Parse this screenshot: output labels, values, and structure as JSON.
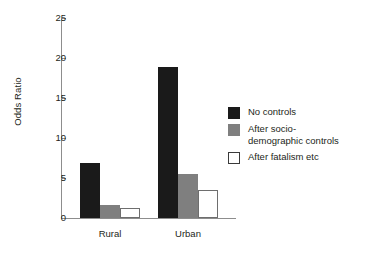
{
  "chart_data": {
    "type": "bar",
    "title": "",
    "xlabel": "",
    "ylabel": "Odds Ratio",
    "ylim": [
      0,
      25
    ],
    "yticks": [
      0,
      5,
      10,
      15,
      20,
      25
    ],
    "ytick_labels": [
      "0",
      "5",
      "10",
      "15",
      "20",
      "25"
    ],
    "grid": false,
    "legend_position": "right",
    "categories": [
      "Rural",
      "Urban"
    ],
    "series": [
      {
        "name": "No controls",
        "color": "#1a1a1a",
        "values": [
          6.9,
          18.9
        ]
      },
      {
        "name": "After socio-demographic controls",
        "color": "#7f7f7f",
        "values": [
          1.6,
          5.5
        ]
      },
      {
        "name": "After fatalism etc",
        "color": "#ffffff",
        "values": [
          1.2,
          3.5
        ]
      }
    ]
  },
  "axis": {
    "y_title": "Odds Ratio"
  },
  "legend": {
    "entries": [
      {
        "label": "No controls",
        "line1": "No controls",
        "line2": ""
      },
      {
        "label": "After socio-demographic controls",
        "line1": "After socio-",
        "line2": "demographic controls"
      },
      {
        "label": "After fatalism etc",
        "line1": "After fatalism etc",
        "line2": ""
      }
    ]
  }
}
